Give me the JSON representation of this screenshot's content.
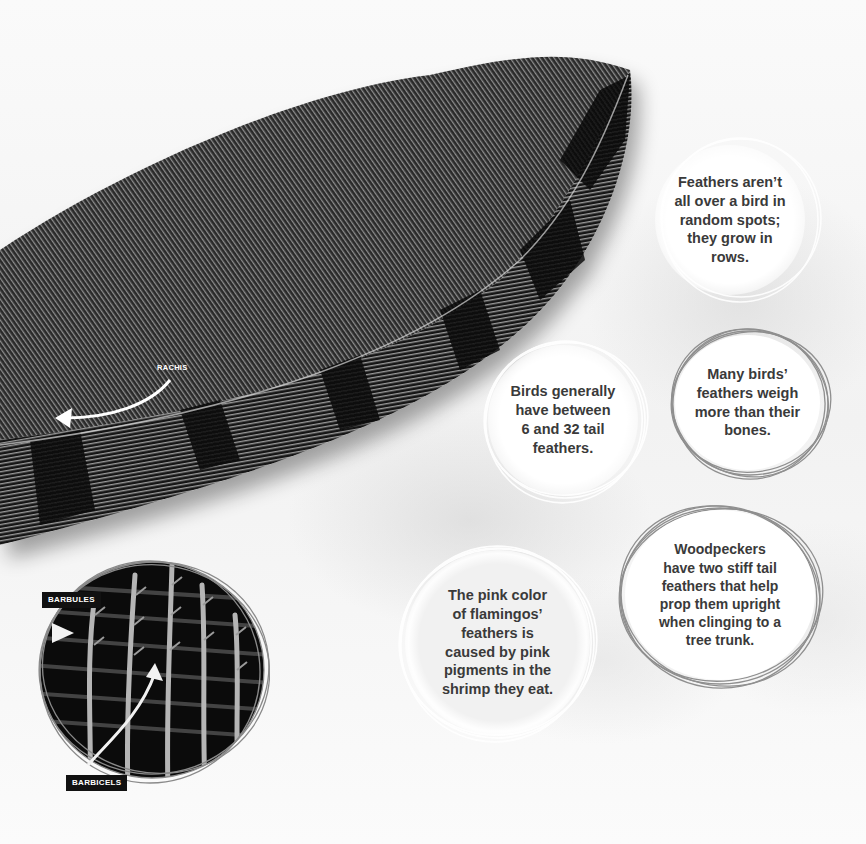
{
  "page": {
    "colors": {
      "background": "#f7f7f7",
      "text": "#3a3a3a",
      "ring": "#8a8a8a",
      "tag_bg": "#111111",
      "tag_text": "#ffffff"
    }
  },
  "feather_image": {
    "labels": {
      "rachis": "RACHIS"
    }
  },
  "microscope_image": {
    "labels": {
      "barbules": "BARBULES",
      "barbicels": "BARBICELS"
    }
  },
  "facts": [
    {
      "lines": [
        "Feathers aren’t",
        "all over a bird in",
        "random spots;",
        "they grow in",
        "rows."
      ]
    },
    {
      "lines": [
        "Birds generally",
        "have between",
        "6 and 32 tail",
        "feathers."
      ]
    },
    {
      "lines": [
        "Many birds’",
        "feathers weigh",
        "more than their",
        "bones."
      ]
    },
    {
      "lines": [
        "Woodpeckers",
        "have two stiff tail",
        "feathers that help",
        "prop them upright",
        "when clinging to a",
        "tree trunk."
      ]
    },
    {
      "lines": [
        "The pink color",
        "of flamingos’",
        "feathers is",
        "caused by pink",
        "pigments in the",
        "shrimp they eat."
      ]
    }
  ]
}
